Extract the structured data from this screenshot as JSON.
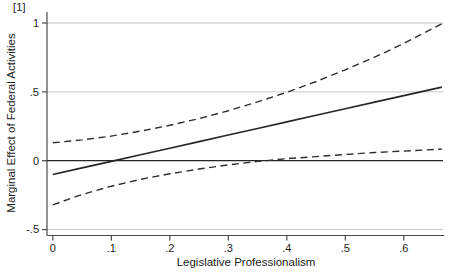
{
  "figure": {
    "panel_label": "[1]",
    "background": "#ffffff"
  },
  "colors": {
    "text": "#1c1c1c",
    "axis": "#4a4a4a",
    "gridline": "#c2c2c2",
    "zero_line": "#262626",
    "effect_line": "#262626",
    "ci_line": "#2e2e2e"
  },
  "chart_data": {
    "type": "line",
    "title": "",
    "xlabel": "Legislative Professionalism",
    "ylabel": "Marginal Effect of Federal Activities",
    "xlim": [
      -0.01,
      0.667
    ],
    "ylim": [
      -0.543,
      1.08
    ],
    "grid": "horizontal",
    "legend_position": "none",
    "reference_line_y": 0,
    "x_ticks": {
      "values": [
        0,
        0.1,
        0.2,
        0.3,
        0.4,
        0.5,
        0.6
      ],
      "labels": [
        "0",
        ".1",
        ".2",
        ".3",
        ".4",
        ".5",
        ".6"
      ]
    },
    "y_ticks": {
      "values": [
        1,
        0.5,
        0,
        -0.5
      ],
      "labels": [
        "1",
        ".5",
        "0",
        "-.5"
      ]
    },
    "x": [
      0,
      0.05,
      0.1,
      0.15,
      0.2,
      0.25,
      0.3,
      0.35,
      0.4,
      0.45,
      0.5,
      0.55,
      0.6,
      0.665
    ],
    "series": [
      {
        "name": "marginal-effect",
        "style": "solid",
        "values": [
          -0.1,
          -0.052,
          -0.005,
          0.043,
          0.091,
          0.139,
          0.187,
          0.234,
          0.282,
          0.33,
          0.378,
          0.426,
          0.473,
          0.535
        ]
      },
      {
        "name": "upper-confidence-bound",
        "style": "dashed",
        "values": [
          0.13,
          0.151,
          0.179,
          0.215,
          0.257,
          0.306,
          0.363,
          0.427,
          0.497,
          0.575,
          0.66,
          0.752,
          0.851,
          0.995
        ]
      },
      {
        "name": "lower-confidence-bound",
        "style": "dashed",
        "values": [
          -0.32,
          -0.245,
          -0.185,
          -0.135,
          -0.095,
          -0.06,
          -0.03,
          -0.005,
          0.015,
          0.03,
          0.045,
          0.06,
          0.07,
          0.085
        ]
      }
    ]
  }
}
